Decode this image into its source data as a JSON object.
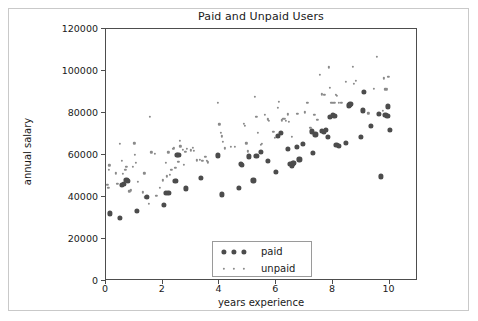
{
  "figure": {
    "background": "#ffffff",
    "frame_color": "#c9c9c9",
    "axes_color": "#4d4d4d"
  },
  "chart_data": {
    "type": "scatter",
    "title": "Paid and Unpaid Users",
    "xlabel": "years experience",
    "ylabel": "annual salary",
    "xlim": [
      0,
      11
    ],
    "ylim": [
      0,
      120000
    ],
    "xticks": [
      0,
      2,
      4,
      6,
      8,
      10
    ],
    "xtick_labels": [
      "0",
      "2",
      "4",
      "6",
      "8",
      "10"
    ],
    "yticks": [
      0,
      20000,
      40000,
      60000,
      80000,
      100000,
      120000
    ],
    "ytick_labels": [
      "0",
      "20000",
      "40000",
      "60000",
      "80000",
      "100000",
      "120000"
    ],
    "grid": false,
    "legend_position": "lower center",
    "series": [
      {
        "name": "paid",
        "marker": "circle",
        "marker_size": "large",
        "color": "#4c4c4c",
        "points": [
          [
            0.15,
            32200
          ],
          [
            0.5,
            30100
          ],
          [
            0.55,
            45800
          ],
          [
            0.62,
            46300
          ],
          [
            0.72,
            48000
          ],
          [
            0.78,
            47600
          ],
          [
            1.08,
            33400
          ],
          [
            1.45,
            40100
          ],
          [
            2.05,
            36200
          ],
          [
            2.12,
            42000
          ],
          [
            2.2,
            42100
          ],
          [
            2.45,
            47800
          ],
          [
            2.5,
            59900
          ],
          [
            2.55,
            60200
          ],
          [
            2.82,
            44100
          ],
          [
            3.35,
            48900
          ],
          [
            3.95,
            59800
          ],
          [
            4.1,
            41200
          ],
          [
            4.7,
            44200
          ],
          [
            4.75,
            55700
          ],
          [
            4.8,
            55400
          ],
          [
            5.05,
            59300
          ],
          [
            5.2,
            47900
          ],
          [
            5.3,
            59400
          ],
          [
            5.45,
            61600
          ],
          [
            5.72,
            57000
          ],
          [
            6.0,
            52100
          ],
          [
            6.05,
            69100
          ],
          [
            6.18,
            70500
          ],
          [
            6.42,
            62900
          ],
          [
            6.5,
            55900
          ],
          [
            6.55,
            54700
          ],
          [
            6.6,
            56000
          ],
          [
            6.62,
            56400
          ],
          [
            6.72,
            64000
          ],
          [
            6.82,
            57900
          ],
          [
            6.95,
            65300
          ],
          [
            7.25,
            71200
          ],
          [
            7.3,
            61100
          ],
          [
            7.38,
            69800
          ],
          [
            7.62,
            71300
          ],
          [
            7.68,
            71100
          ],
          [
            7.75,
            72100
          ],
          [
            7.82,
            68500
          ],
          [
            7.88,
            78000
          ],
          [
            8.0,
            79000
          ],
          [
            8.05,
            78800
          ],
          [
            8.12,
            64900
          ],
          [
            8.2,
            64200
          ],
          [
            8.45,
            65600
          ],
          [
            8.55,
            83600
          ],
          [
            8.6,
            83900
          ],
          [
            8.62,
            84200
          ],
          [
            9.0,
            68600
          ],
          [
            9.05,
            81200
          ],
          [
            9.1,
            90000
          ],
          [
            9.35,
            73900
          ],
          [
            9.62,
            79700
          ],
          [
            9.68,
            49800
          ],
          [
            9.85,
            78900
          ],
          [
            9.92,
            78800
          ],
          [
            9.95,
            83100
          ],
          [
            10.0,
            71800
          ]
        ]
      },
      {
        "name": "unpaid",
        "marker": "circle",
        "marker_size": "small",
        "color": "#8a8a8a",
        "points": [
          [
            0.05,
            45700
          ],
          [
            0.08,
            44300
          ],
          [
            0.1,
            52900
          ],
          [
            0.12,
            55100
          ],
          [
            0.35,
            51200
          ],
          [
            0.4,
            46300
          ],
          [
            0.5,
            65300
          ],
          [
            0.55,
            57200
          ],
          [
            0.6,
            51000
          ],
          [
            0.68,
            52800
          ],
          [
            0.72,
            54200
          ],
          [
            0.82,
            42700
          ],
          [
            0.88,
            43200
          ],
          [
            0.95,
            54400
          ],
          [
            1.0,
            65600
          ],
          [
            1.02,
            60000
          ],
          [
            1.05,
            56100
          ],
          [
            1.12,
            47200
          ],
          [
            1.3,
            42200
          ],
          [
            1.35,
            51300
          ],
          [
            1.38,
            39900
          ],
          [
            1.5,
            36800
          ],
          [
            1.55,
            78100
          ],
          [
            1.6,
            61300
          ],
          [
            1.72,
            60600
          ],
          [
            1.78,
            40500
          ],
          [
            1.9,
            44200
          ],
          [
            2.0,
            47900
          ],
          [
            2.1,
            56400
          ],
          [
            2.15,
            49800
          ],
          [
            2.2,
            61200
          ],
          [
            2.25,
            50600
          ],
          [
            2.3,
            52900
          ],
          [
            2.35,
            62900
          ],
          [
            2.4,
            63100
          ],
          [
            2.45,
            53800
          ],
          [
            2.48,
            48300
          ],
          [
            2.5,
            47700
          ],
          [
            2.55,
            56900
          ],
          [
            2.6,
            66900
          ],
          [
            2.62,
            64100
          ],
          [
            2.7,
            62600
          ],
          [
            2.75,
            55400
          ],
          [
            2.8,
            61400
          ],
          [
            2.85,
            62800
          ],
          [
            3.0,
            62200
          ],
          [
            3.05,
            63400
          ],
          [
            3.1,
            62100
          ],
          [
            3.2,
            57400
          ],
          [
            3.3,
            57800
          ],
          [
            3.4,
            57200
          ],
          [
            3.5,
            59000
          ],
          [
            3.55,
            57300
          ],
          [
            3.6,
            56500
          ],
          [
            3.95,
            85000
          ],
          [
            4.0,
            74600
          ],
          [
            4.05,
            70600
          ],
          [
            4.08,
            68900
          ],
          [
            4.12,
            66400
          ],
          [
            4.18,
            63200
          ],
          [
            4.4,
            64000
          ],
          [
            4.55,
            63800
          ],
          [
            4.85,
            74900
          ],
          [
            4.9,
            73800
          ],
          [
            4.95,
            65500
          ],
          [
            5.0,
            61700
          ],
          [
            5.25,
            87700
          ],
          [
            5.3,
            78100
          ],
          [
            5.35,
            70500
          ],
          [
            5.45,
            64900
          ],
          [
            5.5,
            65400
          ],
          [
            5.6,
            79200
          ],
          [
            5.7,
            77000
          ],
          [
            5.75,
            76200
          ],
          [
            5.9,
            70900
          ],
          [
            5.95,
            68000
          ],
          [
            6.05,
            82600
          ],
          [
            6.1,
            85200
          ],
          [
            6.2,
            76500
          ],
          [
            6.25,
            77300
          ],
          [
            6.3,
            77100
          ],
          [
            6.35,
            76100
          ],
          [
            6.4,
            79300
          ],
          [
            6.45,
            75800
          ],
          [
            6.55,
            68600
          ],
          [
            6.75,
            79700
          ],
          [
            7.0,
            80300
          ],
          [
            7.1,
            84700
          ],
          [
            7.2,
            72900
          ],
          [
            7.35,
            79000
          ],
          [
            7.45,
            76600
          ],
          [
            7.55,
            98000
          ],
          [
            7.62,
            88900
          ],
          [
            7.7,
            88700
          ],
          [
            7.85,
            101700
          ],
          [
            7.9,
            92000
          ],
          [
            7.95,
            84800
          ],
          [
            8.0,
            85000
          ],
          [
            8.05,
            84800
          ],
          [
            8.1,
            88500
          ],
          [
            8.15,
            88300
          ],
          [
            8.2,
            84900
          ],
          [
            8.3,
            84700
          ],
          [
            8.45,
            94700
          ],
          [
            8.7,
            102100
          ],
          [
            8.75,
            93900
          ],
          [
            8.8,
            95300
          ],
          [
            9.25,
            79800
          ],
          [
            9.45,
            91500
          ],
          [
            9.55,
            106800
          ],
          [
            9.75,
            81000
          ],
          [
            9.8,
            96500
          ],
          [
            9.85,
            91300
          ],
          [
            9.9,
            91200
          ],
          [
            9.95,
            97200
          ]
        ]
      }
    ]
  },
  "legend": {
    "entries": [
      {
        "label": "paid",
        "marker_size": "large",
        "color": "#4c4c4c"
      },
      {
        "label": "unpaid",
        "marker_size": "small",
        "color": "#8a8a8a"
      }
    ]
  }
}
